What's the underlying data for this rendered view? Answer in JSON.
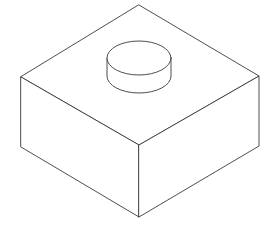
{
  "figure": {
    "background": "#ffffff",
    "stroke_color": "#3a3a3a",
    "block": {
      "top_face": [
        [
          139,
          5
        ],
        [
          259,
          76
        ],
        [
          139,
          145
        ],
        [
          21,
          77
        ]
      ],
      "left_face": [
        [
          21,
          77
        ],
        [
          139,
          145
        ],
        [
          139,
          217
        ],
        [
          21,
          147
        ]
      ],
      "right_face": [
        [
          139,
          145
        ],
        [
          259,
          76
        ],
        [
          259,
          146
        ],
        [
          139,
          217
        ]
      ]
    },
    "cylinder": {
      "cx": 139,
      "top_cy": 58,
      "rx": 32,
      "ry": 17,
      "height": 18
    }
  }
}
